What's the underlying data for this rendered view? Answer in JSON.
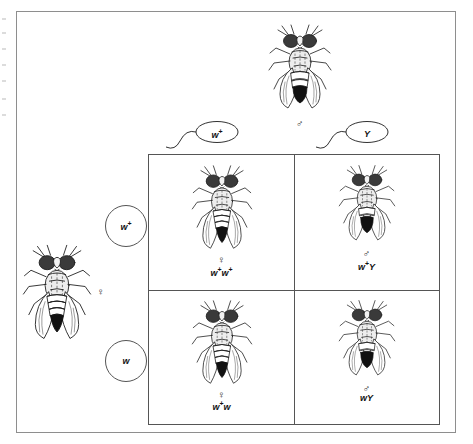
{
  "parents": {
    "female": {
      "sex_symbol": "♀",
      "icon": "fruit-fly-female-icon"
    },
    "male": {
      "sex_symbol": "♂",
      "icon": "fruit-fly-male-icon"
    }
  },
  "maternal_gametes": [
    {
      "allele": "w",
      "superscript": "+",
      "shape": "circle"
    },
    {
      "allele": "w",
      "superscript": "",
      "shape": "circle"
    }
  ],
  "paternal_gametes": [
    {
      "allele": "w",
      "superscript": "+",
      "shape": "sperm"
    },
    {
      "allele": "Y",
      "superscript": "",
      "shape": "sperm"
    }
  ],
  "punnett_cells": [
    {
      "position": "top-left",
      "sex_symbol": "♀",
      "genotype_base": "w",
      "genotype_sup1": "+",
      "genotype_base2": "w",
      "genotype_sup2": "+",
      "fly_type": "female"
    },
    {
      "position": "top-right",
      "sex_symbol": "♂",
      "genotype_base": "w",
      "genotype_sup1": "+",
      "genotype_base2": "Y",
      "genotype_sup2": "",
      "fly_type": "male"
    },
    {
      "position": "bottom-left",
      "sex_symbol": "♀",
      "genotype_base": "w",
      "genotype_sup1": "+",
      "genotype_base2": "w",
      "genotype_sup2": "",
      "fly_type": "female"
    },
    {
      "position": "bottom-right",
      "sex_symbol": "♂",
      "genotype_base": "w",
      "genotype_sup1": "",
      "genotype_base2": "Y",
      "genotype_sup2": "",
      "fly_type": "male"
    }
  ],
  "colors": {
    "frame_border": "#8e8e8e",
    "grid_line": "#555555",
    "ink": "#111111",
    "background": "#ffffff"
  }
}
